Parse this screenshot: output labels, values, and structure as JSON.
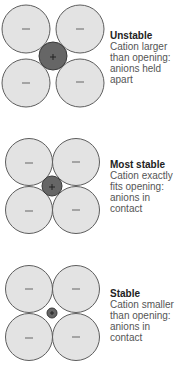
{
  "colors": {
    "anion_fill": "#e3e3e3",
    "anion_stroke": "#5e5e5e",
    "cation_fill": "#666666",
    "title_text": "#222222",
    "body_text": "#555555"
  },
  "anion_symbol": "−",
  "cation_symbol": "+",
  "panels": [
    {
      "title": "Unstable",
      "lines": [
        "Cation larger",
        "than opening:",
        "anions held",
        "apart"
      ],
      "anions": [
        {
          "cx": 26,
          "cy": 29
        },
        {
          "cx": 80,
          "cy": 29
        },
        {
          "cx": 26,
          "cy": 83
        },
        {
          "cx": 80,
          "cy": 83
        }
      ],
      "anion_r": 24,
      "cation": {
        "cx": 53,
        "cy": 56,
        "r": 14
      }
    },
    {
      "title": "Most stable",
      "lines": [
        "Cation exactly",
        "fits opening:",
        "anions in",
        "contact"
      ],
      "anions": [
        {
          "cx": 29,
          "cy": 162
        },
        {
          "cx": 76,
          "cy": 162
        },
        {
          "cx": 29,
          "cy": 210
        },
        {
          "cx": 76,
          "cy": 210
        }
      ],
      "anion_r": 23.5,
      "cation": {
        "cx": 52,
        "cy": 186,
        "r": 10
      }
    },
    {
      "title": "Stable",
      "lines": [
        "Cation smaller",
        "than opening:",
        "anions in",
        "contact"
      ],
      "anions": [
        {
          "cx": 29,
          "cy": 289
        },
        {
          "cx": 76,
          "cy": 289
        },
        {
          "cx": 29,
          "cy": 337
        },
        {
          "cx": 76,
          "cy": 337
        }
      ],
      "anion_r": 23.5,
      "cation": {
        "cx": 52,
        "cy": 313,
        "r": 5
      }
    }
  ]
}
